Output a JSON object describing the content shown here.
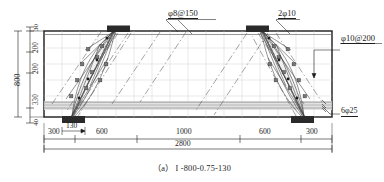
{
  "figure": {
    "caption": "（a） I -800-0.75-130",
    "type": "reinforced-concrete-beam-elevation",
    "beam": {
      "total_depth": "800",
      "total_length": "2800",
      "support_plate_width": "130"
    }
  },
  "rebar_labels": [
    {
      "id": "stirrup-top",
      "text": "φ8@150"
    },
    {
      "id": "top-bars",
      "text": "2φ10"
    },
    {
      "id": "stirrup-side",
      "text": "φ10@200"
    },
    {
      "id": "bottom-bars",
      "text": "6φ25"
    }
  ],
  "dimensions": {
    "vertical_chain": [
      "30",
      "200",
      "200",
      "330",
      "40"
    ],
    "vertical_total": "800",
    "horizontal_chain": [
      "300",
      "600",
      "1000",
      "600",
      "300"
    ],
    "horizontal_total": "2800",
    "plate_width": "130"
  },
  "colors": {
    "line": "#1c1c1c",
    "grid": "#c9c9c9",
    "plate": "#2a2a2a",
    "crack": "#555555",
    "rebar_band": "#d8d8d8",
    "strut_fill": "#eeeeee",
    "background": "#ffffff"
  }
}
